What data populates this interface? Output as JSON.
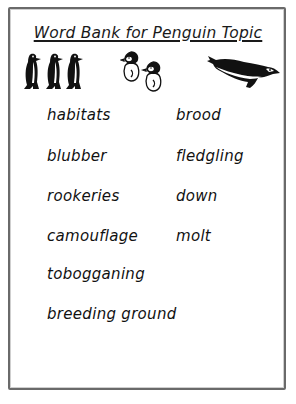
{
  "worksheet": {
    "title": "Word Bank for Penguin Topic",
    "illustrations": [
      {
        "name": "standing-penguins",
        "count": 3
      },
      {
        "name": "penguin-chicks",
        "count": 2
      },
      {
        "name": "sliding-penguin",
        "count": 1
      }
    ],
    "words_left": [
      "habitats",
      "blubber",
      "rookeries",
      "camouflage",
      "tobogganing",
      "breeding ground"
    ],
    "words_right": [
      "brood",
      "fledgling",
      "down",
      "molt"
    ]
  },
  "colors": {
    "ink": "#111111",
    "border": "#6a6a6a",
    "background": "#ffffff"
  }
}
